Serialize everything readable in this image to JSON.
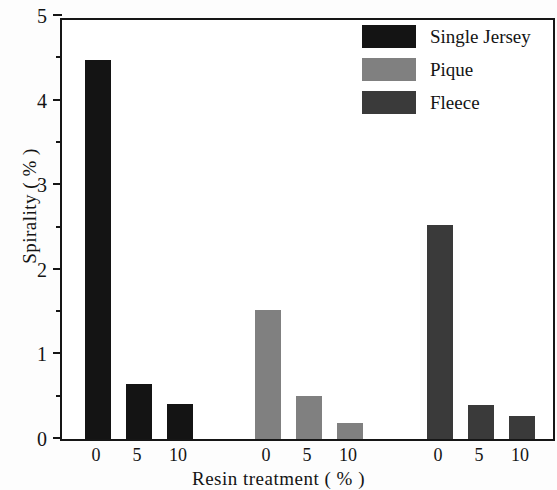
{
  "chart_data": {
    "type": "bar",
    "title": "",
    "xlabel": "Resin treatment ( % )",
    "ylabel": "Spirality ( % )",
    "categories": [
      "0",
      "5",
      "10"
    ],
    "series": [
      {
        "name": "Single Jersey",
        "color": "#141414",
        "values": [
          4.48,
          0.65,
          0.41
        ]
      },
      {
        "name": "Pique",
        "color": "#808080",
        "values": [
          1.52,
          0.51,
          0.19
        ]
      },
      {
        "name": "Fleece",
        "color": "#3a3a3a",
        "values": [
          2.53,
          0.4,
          0.27
        ]
      }
    ],
    "ylim": [
      0,
      5
    ],
    "ytick_labels": [
      "0",
      "1",
      "2",
      "3",
      "4",
      "5"
    ],
    "ytick_values": [
      0,
      1,
      2,
      3,
      4,
      5
    ],
    "yminor_values": [
      0.5,
      1.5,
      2.5,
      3.5,
      4.5
    ],
    "xtick_labels": [
      "0",
      "5",
      "10",
      "0",
      "5",
      "10",
      "0",
      "5",
      "10"
    ],
    "grid": false,
    "legend_position": "top-right",
    "frame": "box"
  }
}
